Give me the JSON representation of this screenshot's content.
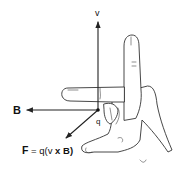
{
  "diagram": {
    "type": "right-hand-rule",
    "vectors": {
      "velocity": {
        "label": "v",
        "direction": "up"
      },
      "magnetic_field": {
        "label": "B",
        "direction": "left"
      },
      "force": {
        "label_prefix": "F = q(v ",
        "cross": "x",
        "label_suffix": " B)",
        "direction": "down-left"
      }
    },
    "charge_label": "q",
    "colors": {
      "ink": "#222222",
      "background": "#ffffff"
    }
  }
}
